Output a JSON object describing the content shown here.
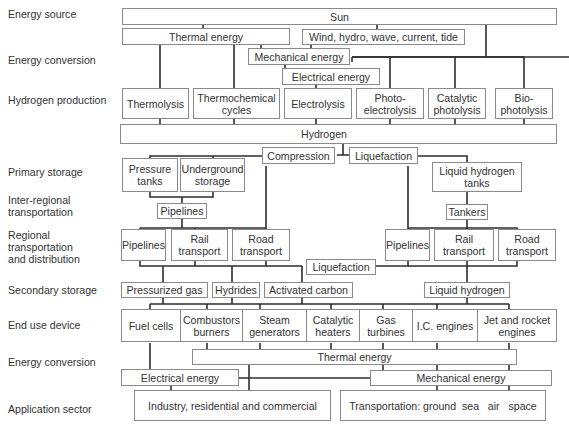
{
  "row_labels": {
    "energy_source": "Energy source",
    "energy_conversion_1": "Energy conversion",
    "hydrogen_production": "Hydrogen production",
    "primary_storage": "Primary storage",
    "inter_regional": "Inter-regional\ntransportation",
    "regional": "Regional\ntransportation\nand distribution",
    "secondary_storage": "Secondary storage",
    "end_use_device": "End use device",
    "energy_conversion_2": "Energy conversion",
    "application_sector": "Application sector"
  },
  "nodes": {
    "sun": "Sun",
    "thermal_energy_top": "Thermal energy",
    "renewables": "Wind, hydro, wave, current, tide",
    "mechanical_energy_top": "Mechanical energy",
    "electrical_energy_top": "Electrical energy",
    "thermolysis": "Thermolysis",
    "thermochemical": "Thermochemical\ncycles",
    "electrolysis": "Electrolysis",
    "photoelectrolysis": "Photo-\nelectrolysis",
    "catalytic_photolysis": "Catalytic\nphotolysis",
    "biophotolysis": "Bio-\nphotolysis",
    "hydrogen": "Hydrogen",
    "compression": "Compression",
    "liquefaction_top": "Liquefaction",
    "pressure_tanks": "Pressure\ntanks",
    "underground_storage": "Underground\nstorage",
    "liquid_hydrogen_tanks": "Liquid hydrogen\ntanks",
    "pipelines_inter": "Pipelines",
    "tankers": "Tankers",
    "pipelines_left": "Pipelines",
    "rail_left": "Rail\ntransport",
    "road_left": "Road\ntransport",
    "pipelines_right": "Pipelines",
    "rail_right": "Rail\ntransport",
    "road_right": "Road\ntransport",
    "liquefaction_mid": "Liquefaction",
    "pressurized_gas": "Pressurized gas",
    "hydrides": "Hydrides",
    "activated_carbon": "Activated carbon",
    "liquid_hydrogen": "Liquid hydrogen",
    "fuel_cells": "Fuel cells",
    "combustors": "Combustors\nburners",
    "steam_generators": "Steam\ngenerators",
    "catalytic_heaters": "Catalytic\nheaters",
    "gas_turbines": "Gas\nturbines",
    "ic_engines": "I.C. engines",
    "jet_rocket": "Jet and rocket\nengines",
    "thermal_energy_bottom": "Thermal energy",
    "electrical_energy_bottom": "Electrical energy",
    "mechanical_energy_bottom": "Mechanical energy",
    "industry": "Industry, residential and commercial",
    "transportation": "Transportation: ground  sea   air   space"
  }
}
